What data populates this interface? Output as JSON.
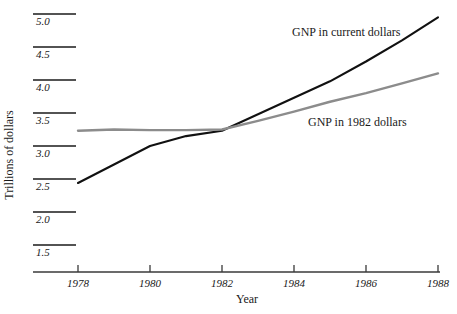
{
  "chart_data": {
    "type": "line",
    "title": "",
    "xlabel": "Year",
    "ylabel": "Trillions of dollars",
    "x": [
      1978,
      1979,
      1980,
      1981,
      1982,
      1983,
      1984,
      1985,
      1986,
      1987,
      1988
    ],
    "xlim": [
      1978,
      1988
    ],
    "ylim": [
      1.5,
      5.0
    ],
    "grid": false,
    "legend_position": "inline-annotation",
    "xticks": [
      "1978",
      "1980",
      "1982",
      "1984",
      "1986",
      "1988"
    ],
    "xtick_values": [
      1978,
      1980,
      1982,
      1984,
      1986,
      1988
    ],
    "yticks": [
      "1.5",
      "2.0",
      "2.5",
      "3.0",
      "3.5",
      "4.0",
      "4.5",
      "5.0"
    ],
    "ytick_values": [
      1.5,
      2.0,
      2.5,
      3.0,
      3.5,
      4.0,
      4.5,
      5.0
    ],
    "series": [
      {
        "name": "GNP in current dollars",
        "color": "#111111",
        "x": [
          1978,
          1979,
          1980,
          1981,
          1982,
          1983,
          1984,
          1985,
          1986,
          1987,
          1988
        ],
        "values": [
          2.44,
          2.72,
          3.0,
          3.15,
          3.23,
          3.48,
          3.73,
          3.98,
          4.28,
          4.6,
          4.95
        ]
      },
      {
        "name": "GNP in 1982 dollars",
        "color": "#8c8c8c",
        "x": [
          1978,
          1979,
          1980,
          1981,
          1982,
          1983,
          1984,
          1985,
          1986,
          1987,
          1988
        ],
        "values": [
          3.23,
          3.25,
          3.24,
          3.24,
          3.25,
          3.38,
          3.52,
          3.67,
          3.8,
          3.95,
          4.1
        ]
      }
    ],
    "annotations": [
      {
        "text": "GNP in current dollars",
        "x_px": 292,
        "y_px": 36
      },
      {
        "text": "GNP in 1982 dollars",
        "x_px": 308,
        "y_px": 126
      }
    ]
  }
}
